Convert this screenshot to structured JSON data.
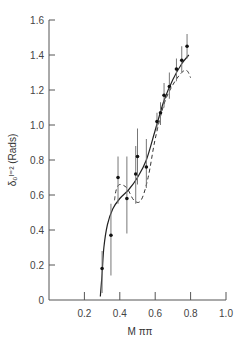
{
  "chart_data": {
    "type": "scatter",
    "title": "",
    "xlabel": "M ππ",
    "ylabel": "δ₀ᴵ⁼² (Rads)",
    "xlim": [
      0,
      1.0
    ],
    "ylim": [
      0,
      1.6
    ],
    "xticks": [
      "0.2",
      "0.4",
      "0.6",
      "0.8",
      "1.0"
    ],
    "yticks": [
      "0",
      "0.2",
      "0.4",
      "0.6",
      "0.8",
      "1.0",
      "1.2",
      "1.4",
      "1.6"
    ],
    "grid": false,
    "series": [
      {
        "name": "data",
        "style": "points-with-error-bars",
        "points": [
          {
            "x": 0.3,
            "y": 0.18,
            "lo": 0.04,
            "hi": 0.28
          },
          {
            "x": 0.35,
            "y": 0.37,
            "lo": 0.14,
            "hi": 0.55
          },
          {
            "x": 0.39,
            "y": 0.7,
            "lo": 0.55,
            "hi": 0.82
          },
          {
            "x": 0.44,
            "y": 0.58,
            "lo": 0.38,
            "hi": 0.82
          },
          {
            "x": 0.49,
            "y": 0.72,
            "lo": 0.55,
            "hi": 0.88
          },
          {
            "x": 0.5,
            "y": 0.82,
            "lo": 0.66,
            "hi": 0.98
          },
          {
            "x": 0.55,
            "y": 0.76,
            "lo": 0.64,
            "hi": 0.92
          },
          {
            "x": 0.61,
            "y": 1.02,
            "lo": 0.97,
            "hi": 1.07
          },
          {
            "x": 0.63,
            "y": 1.07,
            "lo": 1.0,
            "hi": 1.13
          },
          {
            "x": 0.65,
            "y": 1.17,
            "lo": 1.1,
            "hi": 1.24
          },
          {
            "x": 0.68,
            "y": 1.22,
            "lo": 1.15,
            "hi": 1.3
          },
          {
            "x": 0.72,
            "y": 1.32,
            "lo": 1.25,
            "hi": 1.38
          },
          {
            "x": 0.75,
            "y": 1.37,
            "lo": 1.3,
            "hi": 1.45
          },
          {
            "x": 0.78,
            "y": 1.45,
            "lo": 1.38,
            "hi": 1.52
          }
        ]
      },
      {
        "name": "fit-solid",
        "style": "solid-line",
        "x": [
          0.29,
          0.3,
          0.31,
          0.33,
          0.36,
          0.4,
          0.45,
          0.5,
          0.55,
          0.6,
          0.65,
          0.7,
          0.75,
          0.79
        ],
        "y": [
          0.02,
          0.15,
          0.3,
          0.43,
          0.52,
          0.58,
          0.63,
          0.7,
          0.8,
          0.97,
          1.14,
          1.26,
          1.35,
          1.4
        ]
      },
      {
        "name": "fit-dashed",
        "style": "dashed-line",
        "x": [
          0.37,
          0.38,
          0.4,
          0.44,
          0.48,
          0.52,
          0.56,
          0.6,
          0.65,
          0.7,
          0.75,
          0.78,
          0.8
        ],
        "y": [
          0.57,
          0.63,
          0.66,
          0.64,
          0.57,
          0.57,
          0.7,
          0.92,
          1.12,
          1.23,
          1.3,
          1.31,
          1.27
        ]
      }
    ]
  }
}
